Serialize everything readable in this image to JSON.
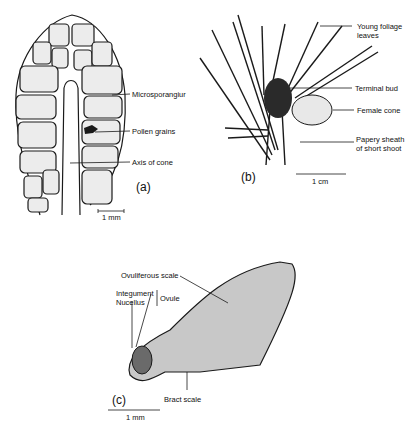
{
  "figure": {
    "panels": [
      {
        "id": "a",
        "label": "(a)",
        "scale_bar": "1 mm",
        "labels": [
          "Microsporangium",
          "Pollen grains",
          "Axis of cone"
        ]
      },
      {
        "id": "b",
        "label": "(b)",
        "scale_bar": "1 cm",
        "labels": [
          "Young foliage leaves",
          "Terminal bud",
          "Female cone",
          "Papery sheath of short shoot"
        ]
      },
      {
        "id": "c",
        "label": "(c)",
        "scale_bar": "1 mm",
        "labels": [
          "Ovuliferous scale",
          "Integument",
          "Nucellus",
          "Ovule",
          "Bract scale"
        ]
      }
    ],
    "text": {
      "a_microsporangium": "Microsporangiur",
      "a_pollen": "Pollen grains",
      "a_axis": "Axis of cone",
      "a_panel": "(a)",
      "a_scale": "1 mm",
      "b_young1": "Young foliage",
      "b_young2": "leaves",
      "b_terminal": "Terminal bud",
      "b_female": "Female cone",
      "b_papery1": "Papery sheath",
      "b_papery2": "of short shoot",
      "b_panel": "(b)",
      "b_scale": "1 cm",
      "c_ovuliferous": "Ovuliferous scale",
      "c_integument": "Integument",
      "c_nucellus": "Nucellus",
      "c_ovule": "Ovule",
      "c_bract": "Bract scale",
      "c_panel": "(c)",
      "c_scale": "1 mm"
    },
    "colors": {
      "line": "#1a1a1a",
      "cell_fill": "#ececec",
      "scale_fill": "#c8c8c8",
      "nucellus_fill": "#6a6a6a",
      "bud_fill": "#2a2a2a"
    }
  }
}
